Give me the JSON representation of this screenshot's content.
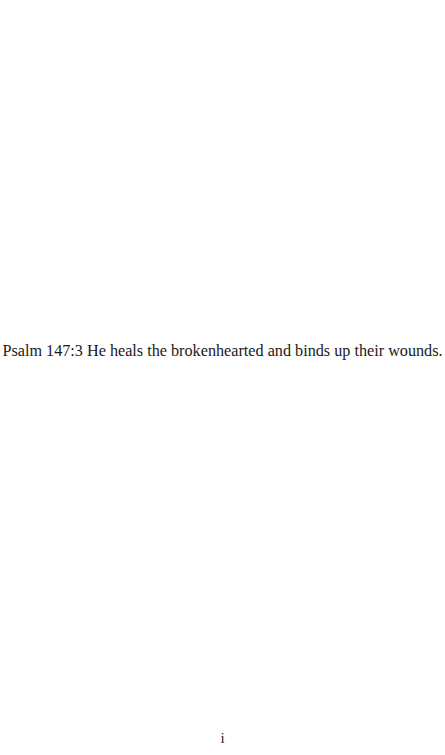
{
  "document": {
    "epigraph": "Psalm 147:3 He heals the brokenhearted and binds up their wounds.",
    "page_number": "i"
  }
}
